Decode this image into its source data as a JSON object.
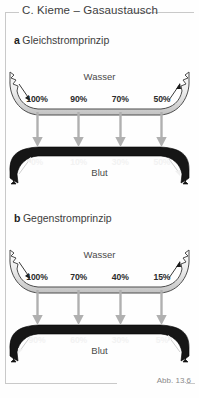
{
  "header": {
    "title": "C. Kieme – Gasaustausch"
  },
  "caption": "Abb. 13.6",
  "colors": {
    "water_fill_light": "#f2f2f2",
    "water_fill_dark": "#b9b9b9",
    "water_stroke": "#4d4d4d",
    "blood_fill": "#161616",
    "blood_stroke": "#000000",
    "transfer_arrow": "#b0b0b0",
    "text_dark": "#3d3d3d",
    "text_light": "#f2f2f2",
    "frame": "#c9c9c9"
  },
  "sections": [
    {
      "letter": "a",
      "title": "Gleichstromprinzip",
      "water": {
        "label": "Wasser",
        "flow_direction": "left-to-right",
        "values": [
          "100%",
          "90%",
          "70%",
          "50%"
        ]
      },
      "blood": {
        "label": "Blut",
        "flow_direction": "left-to-right",
        "values": [
          "0%",
          "10%",
          "30%",
          "50%"
        ]
      },
      "transfer_arrows": 4,
      "transfer_direction": "down"
    },
    {
      "letter": "b",
      "title": "Gegenstromprinzip",
      "water": {
        "label": "Wasser",
        "flow_direction": "left-to-right",
        "values": [
          "100%",
          "70%",
          "40%",
          "15%"
        ]
      },
      "blood": {
        "label": "Blut",
        "flow_direction": "right-to-left",
        "values": [
          "90%",
          "60%",
          "30%",
          "5%"
        ]
      },
      "transfer_arrows": 4,
      "transfer_direction": "down"
    }
  ]
}
